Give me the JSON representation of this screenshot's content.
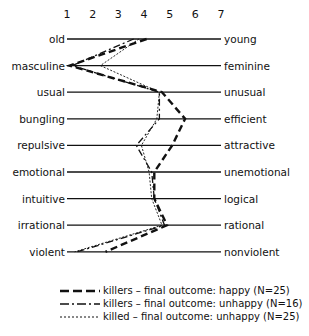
{
  "chart_data": {
    "type": "line",
    "title": "",
    "xlabel": "",
    "ylabel": "",
    "scale_ticks": [
      "1",
      "2",
      "3",
      "4",
      "5",
      "6",
      "7"
    ],
    "xlim": [
      1,
      7
    ],
    "grid": false,
    "legend_position": "bottom",
    "categories": [
      {
        "left": "old",
        "right": "young"
      },
      {
        "left": "masculine",
        "right": "feminine"
      },
      {
        "left": "usual",
        "right": "unusual"
      },
      {
        "left": "bungling",
        "right": "efficient"
      },
      {
        "left": "repulsive",
        "right": "attractive"
      },
      {
        "left": "emotional",
        "right": "unemotional"
      },
      {
        "left": "intuitive",
        "right": "logical"
      },
      {
        "left": "irrational",
        "right": "rational"
      },
      {
        "left": "violent",
        "right": "nonviolent"
      }
    ],
    "series": [
      {
        "name": "killers – final outcome: happy (N=25)",
        "style": "long-dash",
        "values": [
          4.1,
          1.1,
          4.7,
          5.6,
          5.1,
          4.4,
          4.4,
          4.9,
          2.5
        ]
      },
      {
        "name": "killers – final outcome: unhappy (N=16)",
        "style": "dash-dot",
        "values": [
          3.6,
          1.2,
          4.6,
          4.6,
          3.7,
          4.3,
          4.4,
          4.8,
          1.4
        ]
      },
      {
        "name": "killed – final outcome: unhappy (N=25)",
        "style": "dotted",
        "values": [
          3.8,
          2.3,
          4.6,
          4.5,
          3.9,
          4.2,
          4.3,
          4.7,
          1.3
        ]
      }
    ]
  },
  "legend": [
    {
      "label": "killers – final outcome: happy (N=25)"
    },
    {
      "label": "killers – final outcome: unhappy (N=16)"
    },
    {
      "label": "killed – final outcome: unhappy (N=25)"
    }
  ]
}
